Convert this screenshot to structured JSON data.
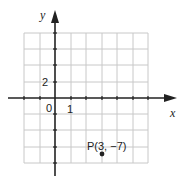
{
  "diagram": {
    "type": "coordinate-plane",
    "axes": {
      "x_label": "x",
      "y_label": "y"
    },
    "tick_labels": {
      "origin": "0",
      "x_unit": "1",
      "y_value": "2"
    },
    "point": {
      "label": "P(3, −7)",
      "x": 3,
      "y": -7
    },
    "colors": {
      "grid": "#c8c8c8",
      "axis": "#222222",
      "point": "#222222"
    }
  }
}
